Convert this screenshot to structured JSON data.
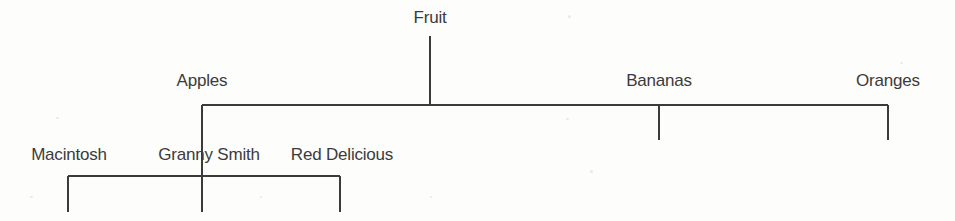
{
  "diagram": {
    "type": "tree-hierarchy",
    "colors": {
      "background": "#fdfdfb",
      "line": "#3b3b3b",
      "text": "#3b3b3b"
    },
    "levels": [
      {
        "name": "root",
        "nodes": [
          {
            "id": "fruit",
            "label": "Fruit",
            "x": 430,
            "y": 17
          }
        ]
      },
      {
        "name": "categories",
        "nodes": [
          {
            "id": "apples",
            "label": "Apples",
            "x": 202,
            "y": 80
          },
          {
            "id": "bananas",
            "label": "Bananas",
            "x": 659,
            "y": 80
          },
          {
            "id": "oranges",
            "label": "Oranges",
            "x": 888,
            "y": 80
          }
        ]
      },
      {
        "name": "varieties",
        "nodes": [
          {
            "id": "macintosh",
            "label": "Macintosh",
            "x": 69,
            "y": 154
          },
          {
            "id": "granny-smith",
            "label": "Granny Smith",
            "x": 209,
            "y": 154
          },
          {
            "id": "red-delicious",
            "label": "Red Delicious",
            "x": 342,
            "y": 154
          }
        ]
      }
    ],
    "connectors": {
      "root_stem": {
        "x": 430,
        "y1": 36,
        "y2": 105
      },
      "level1_bar": {
        "y": 105,
        "x1": 202,
        "x2": 888
      },
      "level1_ticks": [
        {
          "x": 202,
          "y1": 105,
          "y2": 140
        },
        {
          "x": 659,
          "y1": 105,
          "y2": 140
        },
        {
          "x": 888,
          "y1": 105,
          "y2": 140
        }
      ],
      "apples_stem": {
        "x": 202,
        "y1": 140,
        "y2": 176
      },
      "level2_bar": {
        "y": 176,
        "x1": 68,
        "x2": 340
      },
      "level2_ticks": [
        {
          "x": 68,
          "y1": 176,
          "y2": 212
        },
        {
          "x": 202,
          "y1": 176,
          "y2": 212
        },
        {
          "x": 340,
          "y1": 176,
          "y2": 212
        }
      ]
    }
  }
}
